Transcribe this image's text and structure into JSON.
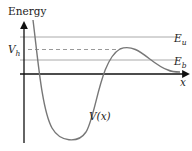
{
  "diagram": {
    "type": "potential-energy-curve",
    "y_axis_label": "Energy",
    "x_axis_label": "x",
    "curve_label": "V(x)",
    "levels": [
      {
        "id": "E_u",
        "symbol": "E",
        "subscript": "u",
        "style": "solid"
      },
      {
        "id": "V_h",
        "symbol": "V",
        "subscript": "h",
        "style": "dashed"
      },
      {
        "id": "E_b",
        "symbol": "E",
        "subscript": "b",
        "style": "solid"
      }
    ],
    "colors": {
      "axis": "#111111",
      "curve": "#777777",
      "level_lines": "#aaaaaa",
      "dashed_line": "#999999",
      "text": "#222222"
    }
  }
}
